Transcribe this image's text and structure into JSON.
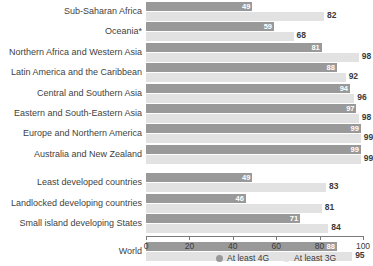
{
  "chart_data": {
    "type": "bar",
    "orientation": "horizontal",
    "title": "",
    "xlabel": "",
    "ylabel": "",
    "xlim": [
      0,
      100
    ],
    "xticks": [
      0,
      20,
      40,
      60,
      80,
      100
    ],
    "grid": false,
    "legend_position": "bottom-right",
    "categories": [
      "Sub-Saharan Africa",
      "Oceania*",
      "Northern Africa and Western Asia",
      "Latin America and the Caribbean",
      "Central and Southern Asia",
      "Eastern and South-Eastern Asia",
      "Europe and Northern America",
      "Australia and New Zealand",
      "Least developed countries",
      "Landlocked developing countries",
      "Small island developing States",
      "World"
    ],
    "series": [
      {
        "name": "At least 4G",
        "color": "#999999",
        "values": [
          49,
          59,
          81,
          88,
          94,
          97,
          99,
          99,
          49,
          46,
          71,
          88
        ]
      },
      {
        "name": "At least 3G",
        "color": "#e2e2e2",
        "values": [
          82,
          68,
          98,
          92,
          96,
          98,
          99,
          99,
          83,
          81,
          84,
          95
        ]
      }
    ],
    "group_breaks_after": [
      7,
      10
    ]
  },
  "legend": {
    "items": [
      {
        "label": "At least 4G",
        "marker": "filled-circle-dark"
      },
      {
        "label": "At least 3G",
        "marker": "filled-circle-light"
      }
    ]
  },
  "axis": {
    "tick_labels": [
      "0",
      "20",
      "40",
      "60",
      "80",
      "100"
    ]
  }
}
